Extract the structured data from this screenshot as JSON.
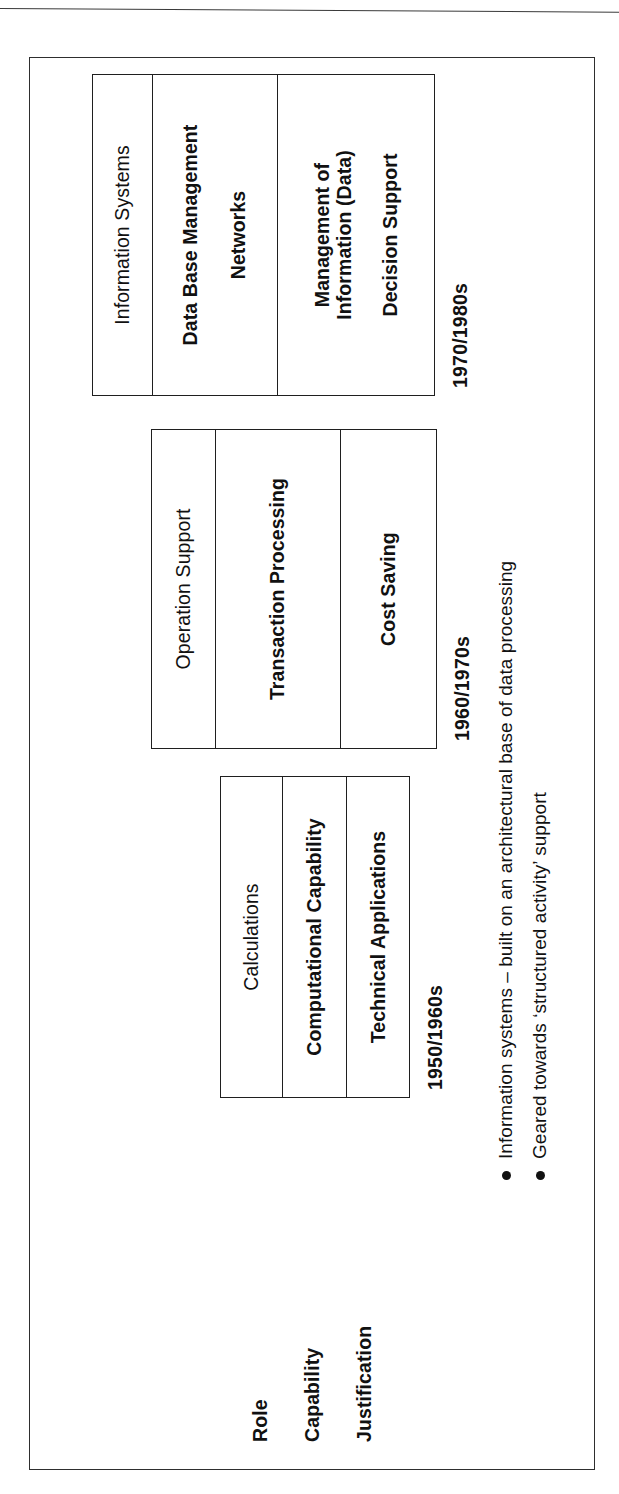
{
  "document": {
    "kind": "scanned-slide",
    "orientation": "rotated-90-ccw",
    "colors": {
      "ink": "#1f1f1f",
      "paper": "#ffffff",
      "rule": "#3a3a3a"
    }
  },
  "row_labels": [
    {
      "id": "role",
      "label": "Role"
    },
    {
      "id": "capability",
      "label": "Capability"
    },
    {
      "id": "justification",
      "label": "Justification"
    }
  ],
  "eras": [
    {
      "id": "era-1950s",
      "period": "1950/1960s",
      "role": "Calculations",
      "capability": "Computational Capability",
      "justification": "Technical Applications"
    },
    {
      "id": "era-1960s",
      "period": "1960/1970s",
      "role": "Operation Support",
      "capability": "Transaction Processing",
      "justification": "Cost Saving"
    },
    {
      "id": "era-1970s",
      "period": "1970/1980s",
      "role": "Information Systems",
      "capability": "Data Base Management\nNetworks",
      "capability_line1": "Data Base Management",
      "capability_line2": "Networks",
      "justification_line1": "Management of",
      "justification_line2": "Information (Data)",
      "justification_line3": "Decision Support"
    }
  ],
  "bullets": [
    {
      "id": "bullet-1",
      "text": "Information systems – built on an architectural base of data processing"
    },
    {
      "id": "bullet-2",
      "text": "Geared towards ‘structured activity’ support"
    }
  ]
}
